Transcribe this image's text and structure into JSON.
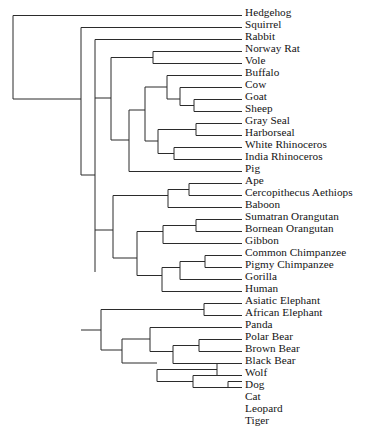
{
  "figure": {
    "type": "phylogenetic-tree",
    "orientation": "left-to-right rectangular cladogram",
    "leaf_count": 31,
    "line_color": "#2b2b2b",
    "text_color": "#131313",
    "background_color": "#ffffff"
  },
  "geometry": {
    "canvas_width": 375,
    "canvas_height": 391,
    "tip_x": 242,
    "label_x": 245,
    "first_leaf_y": 15.5,
    "leaf_spacing": 12.0,
    "root_x": 13,
    "stroke_width": 1
  },
  "leaves": [
    {
      "label": "Hedgehog",
      "index": 0,
      "y": 15.5,
      "branch_x": 13
    },
    {
      "label": "Squirrel",
      "index": 1,
      "y": 27.5,
      "branch_x": 44
    },
    {
      "label": "Rabbit",
      "index": 2,
      "y": 39.5,
      "branch_x": 61
    },
    {
      "label": "Norway Rat",
      "index": 3,
      "y": 51.5,
      "branch_x": 153
    },
    {
      "label": "Vole",
      "index": 4,
      "y": 63.5,
      "branch_x": 197
    },
    {
      "label": "Buffalo",
      "index": 5,
      "y": 75.5,
      "branch_x": 197
    },
    {
      "label": "Cow",
      "index": 6,
      "y": 87.5,
      "branch_x": 210
    },
    {
      "label": "Goat",
      "index": 7,
      "y": 99.5,
      "branch_x": 210
    },
    {
      "label": "Sheep",
      "index": 8,
      "y": 111.5,
      "branch_x": 194
    },
    {
      "label": "Gray Seal",
      "index": 9,
      "y": 123.5,
      "branch_x": 228
    },
    {
      "label": "Harborseal",
      "index": 10,
      "y": 135.5,
      "branch_x": 228
    },
    {
      "label": "White Rhinoceros",
      "index": 11,
      "y": 147.5,
      "branch_x": 174
    },
    {
      "label": "India Rhinoceros",
      "index": 12,
      "y": 159.5,
      "branch_x": 174
    },
    {
      "label": "Pig",
      "index": 13,
      "y": 171.5,
      "branch_x": 129
    },
    {
      "label": "Ape",
      "index": 14,
      "y": 183.5,
      "branch_x": 202
    },
    {
      "label": "Cercopithecus Aethiops",
      "index": 15,
      "y": 195.5,
      "branch_x": 202
    },
    {
      "label": "Baboon",
      "index": 16,
      "y": 207.5,
      "branch_x": 183
    },
    {
      "label": "Sumatran Orangutan",
      "index": 17,
      "y": 219.5,
      "branch_x": 220
    },
    {
      "label": "Bornean Orangutan",
      "index": 18,
      "y": 231.5,
      "branch_x": 220
    },
    {
      "label": "Gibbon",
      "index": 19,
      "y": 243.5,
      "branch_x": 190
    },
    {
      "label": "Common Chimpanzee",
      "index": 20,
      "y": 255.5,
      "branch_x": 216
    },
    {
      "label": "Pigmy Chimpanzee",
      "index": 21,
      "y": 267.5,
      "branch_x": 216
    },
    {
      "label": "Gorilla",
      "index": 22,
      "y": 279.5,
      "branch_x": 205
    },
    {
      "label": "Human",
      "index": 23,
      "y": 291.5,
      "branch_x": 196
    },
    {
      "label": "Asiatic Elephant",
      "index": 24,
      "y": 303.5,
      "branch_x": 231
    },
    {
      "label": "African Elephant",
      "index": 25,
      "y": 315.5,
      "branch_x": 231
    },
    {
      "label": "Panda",
      "index": 26,
      "y": 327.5,
      "branch_x": 150
    },
    {
      "label": "Polar Bear",
      "index": 27,
      "y": 339.5,
      "branch_x": 209
    },
    {
      "label": "Brown Bear",
      "index": 28,
      "y": 351.5,
      "branch_x": 209
    },
    {
      "label": "Black Bear",
      "index": 29,
      "y": 363.5,
      "branch_x": 190
    },
    {
      "label": "Wolf",
      "index": 30,
      "y": 375.5,
      "branch_x": 234
    },
    {
      "label": "Dog",
      "index": 31,
      "y": 387.5,
      "branch_x": 234
    }
  ],
  "tree_rows": [
    "Hedgehog",
    "Squirrel",
    "Rabbit",
    "Norway Rat",
    "Vole",
    "Buffalo",
    "Cow",
    "Goat",
    "Sheep",
    "Gray Seal",
    "Harborseal",
    "White Rhinoceros",
    "India Rhinoceros",
    "Pig",
    "Ape",
    "Cercopithecus Aethiops",
    "Baboon",
    "Sumatran Orangutan",
    "Bornean Orangutan",
    "Gibbon",
    "Common Chimpanzee",
    "Pigmy Chimpanzee",
    "Gorilla",
    "Human",
    "Asiatic Elephant",
    "African Elephant",
    "Panda",
    "Polar Bear",
    "Brown Bear",
    "Black Bear",
    "Wolf",
    "Dog",
    "Cat",
    "Leopard",
    "Tiger"
  ],
  "newick": "(Hedgehog,((Squirrel,(Rabbit,((NorwayRat,Vole),(((Buffalo,(Cow,(Goat,Sheep))),((GraySeal,Harborseal),(WhiteRhinoceros,IndiaRhinoceros))),Pig)))),(((Ape,CercopithecusAethiops),Baboon),(((SumatranOrangutan,BorneanOrangutan),Gibbon),(((CommonChimpanzee,PigmyChimpanzee),Gorilla),Human))),((AsiaticElephant,AfricanElephant),((Panda,((PolarBear,BrownBear),BlackBear)),((Wolf,Dog),(Cat,(Leopard,Tiger)))))))",
  "edges": [
    {
      "name": "root-vertical",
      "x1": 13,
      "y1": 15.5,
      "x2": 13,
      "y2": 99.0
    },
    {
      "name": "hedgehog-tip",
      "x1": 13,
      "y1": 15.5,
      "x2": 242,
      "y2": 15.5
    },
    {
      "name": "root-to-nodeA",
      "x1": 13,
      "y1": 99.0,
      "x2": 81,
      "y2": 99.0
    },
    {
      "name": "nodeA-vertical",
      "x1": 81,
      "y1": 27.5,
      "x2": 81,
      "y2": 175.0
    },
    {
      "name": "squirrel-tip",
      "x1": 81,
      "y1": 27.5,
      "x2": 242,
      "y2": 27.5
    },
    {
      "name": "nodeA-to-nodeB",
      "x1": 81,
      "y1": 175.0,
      "x2": 95,
      "y2": 175.0
    },
    {
      "name": "nodeB-vertical",
      "x1": 95,
      "y1": 39.5,
      "x2": 95,
      "y2": 272.0
    },
    {
      "name": "rabbit-tip",
      "x1": 95,
      "y1": 39.5,
      "x2": 242,
      "y2": 39.5
    },
    {
      "name": "nodeB-to-rodentia-ungul",
      "x1": 95,
      "y1": 98.0,
      "x2": 111,
      "y2": 98.0
    },
    {
      "name": "nodeC-vertical",
      "x1": 111,
      "y1": 57.5,
      "x2": 111,
      "y2": 140.0
    },
    {
      "name": "nodeC-to-murid",
      "x1": 111,
      "y1": 57.5,
      "x2": 153,
      "y2": 57.5
    },
    {
      "name": "murid-vertical",
      "x1": 153,
      "y1": 51.5,
      "x2": 153,
      "y2": 63.5
    },
    {
      "name": "norway-rat-tip",
      "x1": 153,
      "y1": 51.5,
      "x2": 242,
      "y2": 51.5
    },
    {
      "name": "vole-tip",
      "x1": 153,
      "y1": 63.5,
      "x2": 242,
      "y2": 63.5
    },
    {
      "name": "nodeC-to-laurasia",
      "x1": 111,
      "y1": 140.0,
      "x2": 129,
      "y2": 140.0
    },
    {
      "name": "laurasia-vertical",
      "x1": 129,
      "y1": 110.0,
      "x2": 129,
      "y2": 171.5
    },
    {
      "name": "pig-tip",
      "x1": 129,
      "y1": 171.5,
      "x2": 242,
      "y2": 171.5
    },
    {
      "name": "laurasia-to-nodeD",
      "x1": 129,
      "y1": 110.0,
      "x2": 145,
      "y2": 110.0
    },
    {
      "name": "nodeD-vertical",
      "x1": 145,
      "y1": 87.0,
      "x2": 145,
      "y2": 141.0
    },
    {
      "name": "nodeD-to-artio",
      "x1": 145,
      "y1": 87.0,
      "x2": 167,
      "y2": 87.0
    },
    {
      "name": "artio-vertical",
      "x1": 167,
      "y1": 75.5,
      "x2": 167,
      "y2": 99.0
    },
    {
      "name": "buffalo-tip",
      "x1": 167,
      "y1": 75.5,
      "x2": 242,
      "y2": 75.5
    },
    {
      "name": "artio-to-bovid",
      "x1": 167,
      "y1": 99.0,
      "x2": 180,
      "y2": 99.0
    },
    {
      "name": "bovid-vertical",
      "x1": 180,
      "y1": 87.5,
      "x2": 180,
      "y2": 105.5
    },
    {
      "name": "cow-tip",
      "x1": 180,
      "y1": 87.5,
      "x2": 242,
      "y2": 87.5
    },
    {
      "name": "bovid-to-caprine",
      "x1": 180,
      "y1": 105.5,
      "x2": 194,
      "y2": 105.5
    },
    {
      "name": "caprine-vertical",
      "x1": 194,
      "y1": 99.5,
      "x2": 194,
      "y2": 111.5
    },
    {
      "name": "goat-tip",
      "x1": 194,
      "y1": 99.5,
      "x2": 242,
      "y2": 99.5
    },
    {
      "name": "sheep-tip",
      "x1": 194,
      "y1": 111.5,
      "x2": 242,
      "y2": 111.5
    },
    {
      "name": "nodeD-to-ferrhino",
      "x1": 145,
      "y1": 141.0,
      "x2": 158,
      "y2": 141.0
    },
    {
      "name": "ferrhino-vertical",
      "x1": 158,
      "y1": 129.5,
      "x2": 158,
      "y2": 153.5
    },
    {
      "name": "ferrhino-to-seals",
      "x1": 158,
      "y1": 129.5,
      "x2": 196,
      "y2": 129.5
    },
    {
      "name": "seal-vertical",
      "x1": 196,
      "y1": 123.5,
      "x2": 196,
      "y2": 135.5
    },
    {
      "name": "gray-seal-tip",
      "x1": 196,
      "y1": 123.5,
      "x2": 242,
      "y2": 123.5
    },
    {
      "name": "harborseal-tip",
      "x1": 196,
      "y1": 135.5,
      "x2": 242,
      "y2": 135.5
    },
    {
      "name": "ferrhino-to-rhinos",
      "x1": 158,
      "y1": 153.5,
      "x2": 174,
      "y2": 153.5
    },
    {
      "name": "rhino-vertical",
      "x1": 174,
      "y1": 147.5,
      "x2": 174,
      "y2": 159.5
    },
    {
      "name": "white-rhino-tip",
      "x1": 174,
      "y1": 147.5,
      "x2": 242,
      "y2": 147.5
    },
    {
      "name": "india-rhino-tip",
      "x1": 174,
      "y1": 159.5,
      "x2": 242,
      "y2": 159.5
    },
    {
      "name": "nodeB-to-primates",
      "x1": 95,
      "y1": 230.0,
      "x2": 113,
      "y2": 230.0
    },
    {
      "name": "primate-vertical",
      "x1": 113,
      "y1": 195.5,
      "x2": 113,
      "y2": 258.0
    },
    {
      "name": "primate-to-cercopith",
      "x1": 113,
      "y1": 195.5,
      "x2": 168,
      "y2": 195.5
    },
    {
      "name": "cercopith-vertical",
      "x1": 168,
      "y1": 189.5,
      "x2": 168,
      "y2": 207.5
    },
    {
      "name": "cercopith-to-apepair",
      "x1": 168,
      "y1": 189.5,
      "x2": 189,
      "y2": 189.5
    },
    {
      "name": "apepair-vertical",
      "x1": 189,
      "y1": 183.5,
      "x2": 189,
      "y2": 195.5
    },
    {
      "name": "ape-tip",
      "x1": 189,
      "y1": 183.5,
      "x2": 242,
      "y2": 183.5
    },
    {
      "name": "cercopithecus-tip",
      "x1": 189,
      "y1": 195.5,
      "x2": 242,
      "y2": 195.5
    },
    {
      "name": "baboon-tip",
      "x1": 168,
      "y1": 207.5,
      "x2": 242,
      "y2": 207.5
    },
    {
      "name": "primate-to-hominoid",
      "x1": 113,
      "y1": 258.0,
      "x2": 137,
      "y2": 258.0
    },
    {
      "name": "hominoid-vertical",
      "x1": 137,
      "y1": 231.5,
      "x2": 137,
      "y2": 275.5
    },
    {
      "name": "hominoid-to-orangclade",
      "x1": 137,
      "y1": 231.5,
      "x2": 163,
      "y2": 231.5
    },
    {
      "name": "orangclade-vertical",
      "x1": 163,
      "y1": 225.5,
      "x2": 163,
      "y2": 243.5
    },
    {
      "name": "orangclade-to-orangs",
      "x1": 163,
      "y1": 225.5,
      "x2": 196,
      "y2": 225.5
    },
    {
      "name": "orang-vertical",
      "x1": 196,
      "y1": 219.5,
      "x2": 196,
      "y2": 231.5
    },
    {
      "name": "sumatran-orang-tip",
      "x1": 196,
      "y1": 219.5,
      "x2": 242,
      "y2": 219.5
    },
    {
      "name": "bornean-orang-tip",
      "x1": 196,
      "y1": 231.5,
      "x2": 242,
      "y2": 231.5
    },
    {
      "name": "gibbon-tip",
      "x1": 163,
      "y1": 243.5,
      "x2": 242,
      "y2": 243.5
    },
    {
      "name": "hominoid-to-homininae",
      "x1": 137,
      "y1": 275.5,
      "x2": 162,
      "y2": 275.5
    },
    {
      "name": "homininae-vertical",
      "x1": 162,
      "y1": 267.5,
      "x2": 162,
      "y2": 291.5
    },
    {
      "name": "homininae-to-gorillaclade",
      "x1": 162,
      "y1": 267.5,
      "x2": 180,
      "y2": 267.5
    },
    {
      "name": "gorillaclade-vertical",
      "x1": 180,
      "y1": 261.5,
      "x2": 180,
      "y2": 279.5
    },
    {
      "name": "gorillaclade-to-chimps",
      "x1": 180,
      "y1": 261.5,
      "x2": 205,
      "y2": 261.5
    },
    {
      "name": "chimp-vertical",
      "x1": 205,
      "y1": 255.5,
      "x2": 205,
      "y2": 267.5
    },
    {
      "name": "common-chimp-tip",
      "x1": 205,
      "y1": 255.5,
      "x2": 242,
      "y2": 255.5
    },
    {
      "name": "pigmy-chimp-tip",
      "x1": 205,
      "y1": 267.5,
      "x2": 242,
      "y2": 267.5
    },
    {
      "name": "gorilla-tip",
      "x1": 180,
      "y1": 279.5,
      "x2": 242,
      "y2": 279.5
    },
    {
      "name": "human-tip",
      "x1": 162,
      "y1": 291.5,
      "x2": 242,
      "y2": 291.5
    },
    {
      "name": "nodeA-to-afroCarn",
      "x1": 81,
      "y1": 330.0,
      "x2": 101,
      "y2": 330.0
    },
    {
      "name": "afroCarn-vertical",
      "x1": 101,
      "y1": 309.5,
      "x2": 101,
      "y2": 350.0
    },
    {
      "name": "afroCarn-to-elephants",
      "x1": 101,
      "y1": 309.5,
      "x2": 204,
      "y2": 309.5
    },
    {
      "name": "elephant-vertical",
      "x1": 204,
      "y1": 303.5,
      "x2": 204,
      "y2": 315.5
    },
    {
      "name": "asiatic-elephant-tip",
      "x1": 204,
      "y1": 303.5,
      "x2": 242,
      "y2": 303.5
    },
    {
      "name": "african-elephant-tip",
      "x1": 204,
      "y1": 315.5,
      "x2": 242,
      "y2": 315.5
    },
    {
      "name": "afroCarn-to-carnivora",
      "x1": 101,
      "y1": 350.0,
      "x2": 122,
      "y2": 350.0
    },
    {
      "name": "carnivora-vertical",
      "x1": 122,
      "y1": 339.0,
      "x2": 122,
      "y2": 363.0
    },
    {
      "name": "carnivora-to-ursids",
      "x1": 122,
      "y1": 339.0,
      "x2": 150,
      "y2": 339.0
    },
    {
      "name": "ursid-vertical",
      "x1": 150,
      "y1": 327.5,
      "x2": 150,
      "y2": 351.5
    },
    {
      "name": "panda-tip",
      "x1": 150,
      "y1": 327.5,
      "x2": 242,
      "y2": 327.5
    },
    {
      "name": "ursid-to-bears",
      "x1": 150,
      "y1": 351.5,
      "x2": 173,
      "y2": 351.5
    },
    {
      "name": "bear-vertical",
      "x1": 173,
      "y1": 345.5,
      "x2": 173,
      "y2": 363.5
    },
    {
      "name": "bear-to-polarbrown",
      "x1": 173,
      "y1": 345.5,
      "x2": 199,
      "y2": 345.5
    },
    {
      "name": "polarbrown-vertical",
      "x1": 199,
      "y1": 339.5,
      "x2": 199,
      "y2": 351.5
    },
    {
      "name": "polar-bear-tip",
      "x1": 199,
      "y1": 339.5,
      "x2": 242,
      "y2": 339.5
    },
    {
      "name": "brown-bear-tip",
      "x1": 199,
      "y1": 351.5,
      "x2": 242,
      "y2": 351.5
    },
    {
      "name": "black-bear-tip",
      "x1": 173,
      "y1": 363.5,
      "x2": 242,
      "y2": 363.5
    },
    {
      "name": "carnivora-to-caniform",
      "x1": 122,
      "y1": 363.0,
      "x2": 157,
      "y2": 363.0
    },
    {
      "name": "caniform-vertical",
      "x1": 157,
      "y1": 369.5,
      "x2": 157,
      "y2": 381.5
    },
    {
      "name": "caniform-to-canids",
      "x1": 157,
      "y1": 369.5,
      "x2": 217,
      "y2": 369.5
    },
    {
      "name": "canid-vertical",
      "x1": 217,
      "y1": 375.5,
      "x2": 217,
      "y2": 363.5
    },
    {
      "name": "wolf-tip",
      "x1": 217,
      "y1": 375.5,
      "x2": 242,
      "y2": 375.5
    },
    {
      "name": "dog-tip",
      "x1": 217,
      "y1": 363.5,
      "x2": 242,
      "y2": 363.5
    },
    {
      "name": "caniform-to-felids",
      "x1": 157,
      "y1": 381.5,
      "x2": 193,
      "y2": 381.5
    },
    {
      "name": "felid-vertical",
      "x1": 193,
      "y1": 375.5,
      "x2": 193,
      "y2": 387.5
    },
    {
      "name": "cat-tip",
      "x1": 193,
      "y1": 375.5,
      "x2": 242,
      "y2": 375.5
    },
    {
      "name": "felid-to-pantherines",
      "x1": 193,
      "y1": 387.5,
      "x2": 228,
      "y2": 387.5
    },
    {
      "name": "pantherine-vertical",
      "x1": 228,
      "y1": 381.5,
      "x2": 228,
      "y2": 387.5
    },
    {
      "name": "leopard-tip",
      "x1": 228,
      "y1": 381.5,
      "x2": 242,
      "y2": 381.5
    },
    {
      "name": "tiger-tip",
      "x1": 228,
      "y1": 387.5,
      "x2": 242,
      "y2": 387.5
    }
  ]
}
